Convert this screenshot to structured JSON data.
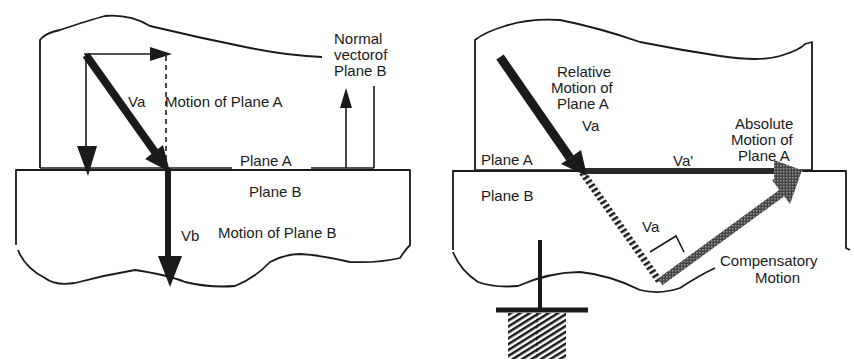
{
  "left_panel": {
    "labels": {
      "va": "Va",
      "motion_plane_a": "Motion of Plane A",
      "normal_line1": "Normal",
      "normal_line2": "vectorof",
      "normal_line3": "Plane B",
      "plane_a": "Plane A",
      "plane_b": "Plane B",
      "vb": "Vb",
      "motion_plane_b": "Motion of Plane B"
    }
  },
  "right_panel": {
    "labels": {
      "relative_line1": "Relative",
      "relative_line2": "Motion of",
      "relative_line3": "Plane A",
      "va": "Va",
      "absolute_line1": "Absolute",
      "absolute_line2": "Motion of",
      "absolute_line3": "Plane A",
      "plane_a": "Plane A",
      "va_prime": "Va'",
      "plane_b": "Plane B",
      "va_perp": "Va",
      "compensatory_line1": "Compensatory",
      "compensatory_line2": "Motion"
    }
  },
  "colors": {
    "ink": "#1a1a1a",
    "gray_arrow": "#555555",
    "background": "#ffffff"
  }
}
